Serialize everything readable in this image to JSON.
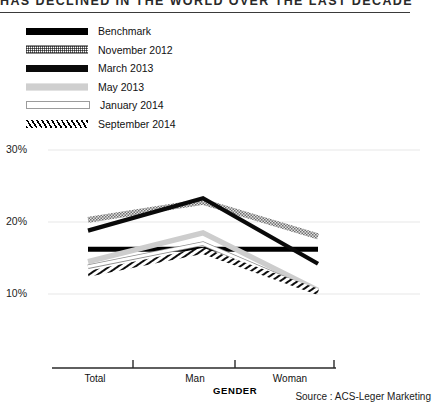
{
  "header": {
    "title": "HAS DECLINED IN THE WORLD OVER THE LAST DECADE"
  },
  "legend": {
    "items": [
      {
        "label": "Benchmark",
        "style": "solid-black-thick"
      },
      {
        "label": "November 2012",
        "style": "gray-checkered"
      },
      {
        "label": "March 2013",
        "style": "solid-black"
      },
      {
        "label": "May 2013",
        "style": "light-gray"
      },
      {
        "label": "January 2014",
        "style": "white-outlined"
      },
      {
        "label": "September 2014",
        "style": "diagonal-hatch"
      }
    ]
  },
  "footer": {
    "source": "Source : ACS-Leger Marketing"
  },
  "chart_data": {
    "type": "line",
    "title": "HAS DECLINED IN THE WORLD OVER THE LAST DECADE",
    "xlabel": "GENDER",
    "ylabel": "",
    "categories": [
      "Total",
      "Man",
      "Woman"
    ],
    "ytick_labels": [
      "30%",
      "20%",
      "10%"
    ],
    "yticks": [
      30,
      20,
      10
    ],
    "ylim": [
      8,
      31
    ],
    "grid": true,
    "legend_position": "top-left",
    "series": [
      {
        "name": "Benchmark",
        "values": [
          16.2,
          16.2,
          16.2
        ],
        "color": "#000000",
        "style": "solid-black-thick"
      },
      {
        "name": "November 2012",
        "values": [
          20.3,
          22.8,
          18.0
        ],
        "color": "#6f6f6f",
        "style": "gray-checkered"
      },
      {
        "name": "March 2013",
        "values": [
          18.8,
          23.3,
          14.2
        ],
        "color": "#0a0a0a",
        "style": "solid-black"
      },
      {
        "name": "May 2013",
        "values": [
          14.5,
          18.5,
          10.5
        ],
        "color": "#c9c9c9",
        "style": "light-gray"
      },
      {
        "name": "January 2014",
        "values": [
          13.8,
          17.0,
          10.2
        ],
        "color": "#9c9c9c",
        "style": "white-outlined"
      },
      {
        "name": "September 2014",
        "values": [
          12.8,
          16.0,
          10.3
        ],
        "color": "#111111",
        "style": "diagonal-hatch"
      }
    ]
  }
}
